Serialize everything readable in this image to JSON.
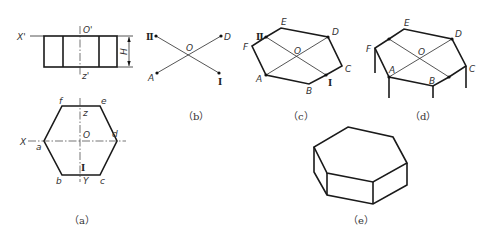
{
  "figure": {
    "panels": {
      "a": {
        "caption": "（a）",
        "front_view": {
          "labels": {
            "x_axis": "X'",
            "origin": "O'",
            "z_axis": "z'",
            "height": "H"
          }
        },
        "top_view": {
          "labels": {
            "x_axis": "X",
            "origin": "O",
            "y_axis": "Y",
            "z": "z",
            "point_I": "Ⅰ",
            "a": "a",
            "b": "b",
            "c": "c",
            "d": "d",
            "e": "e",
            "f": "f"
          }
        }
      },
      "b": {
        "caption": "（b）",
        "labels": {
          "II": "Ⅱ",
          "D": "D",
          "O": "O",
          "A": "A",
          "I": "Ⅰ"
        }
      },
      "c": {
        "caption": "（c）",
        "labels": {
          "II": "Ⅱ",
          "E": "E",
          "D": "D",
          "F": "F",
          "O": "O",
          "C": "C",
          "A": "A",
          "B": "B",
          "I": "Ⅰ"
        }
      },
      "d": {
        "caption": "（d）",
        "labels": {
          "E": "E",
          "D": "D",
          "F": "F",
          "O": "O",
          "A": "A",
          "B": "B",
          "C": "C"
        }
      },
      "e": {
        "caption": "（e）"
      }
    }
  }
}
